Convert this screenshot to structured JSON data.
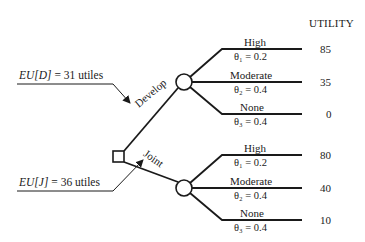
{
  "diagram": {
    "type": "decision-tree",
    "utility_header": "UTILITY",
    "decision_node": {
      "shape": "square"
    },
    "expected_utilities": [
      {
        "label_var": "EU[D]",
        "label_rest": " = 31 utiles",
        "points_to": "Develop"
      },
      {
        "label_var": "EU[J]",
        "label_rest": " = 36 utiles",
        "points_to": "Joint"
      }
    ],
    "branches": [
      {
        "name": "Develop",
        "outcomes": [
          {
            "label": "High",
            "prob": "θ₁ = 0.2",
            "utility": "85"
          },
          {
            "label": "Moderate",
            "prob": "θ₂ = 0.4",
            "utility": "35"
          },
          {
            "label": "None",
            "prob": "θ₃ = 0.4",
            "utility": "0"
          }
        ]
      },
      {
        "name": "Joint",
        "outcomes": [
          {
            "label": "High",
            "prob": "θ₁ = 0.2",
            "utility": "80"
          },
          {
            "label": "Moderate",
            "prob": "θ₂ = 0.4",
            "utility": "40"
          },
          {
            "label": "None",
            "prob": "θ₃ = 0.4",
            "utility": "10"
          }
        ]
      }
    ]
  }
}
